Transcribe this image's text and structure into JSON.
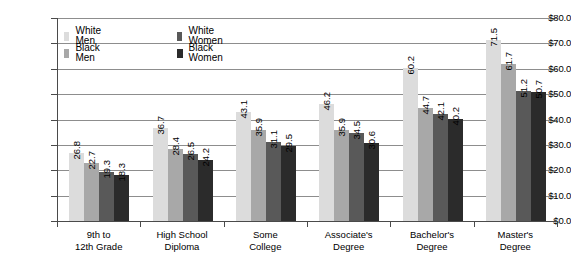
{
  "chart_data": {
    "type": "bar",
    "title": "",
    "subtitle": "",
    "xlabel": "",
    "ylabel": "",
    "ylim": [
      0,
      80
    ],
    "ytick_step": 10,
    "ytick_labels": [
      "$0.0",
      "$10.0",
      "$20.0",
      "$30.0",
      "$40.0",
      "$50.0",
      "$60.0",
      "$70.0",
      "$80.0"
    ],
    "ytick_values": [
      0,
      10,
      20,
      30,
      40,
      50,
      60,
      70,
      80
    ],
    "grid": true,
    "grid_axis": "y",
    "legend_position": "top-left-inside",
    "categories": [
      "9th to\n12th Grade",
      "High School\nDiploma",
      "Some\nCollege",
      "Associate's\nDegree",
      "Bachelor's\nDegree",
      "Master's\nDegree"
    ],
    "category_lines": [
      [
        "9th to",
        "12th Grade"
      ],
      [
        "High School",
        "Diploma"
      ],
      [
        "Some",
        "College"
      ],
      [
        "Associate's",
        "Degree"
      ],
      [
        "Bachelor's",
        "Degree"
      ],
      [
        "Master's",
        "Degree"
      ]
    ],
    "series": [
      {
        "name": "White Men",
        "color": "#dcdcdc",
        "values": [
          26.8,
          36.7,
          43.1,
          46.2,
          60.2,
          71.5
        ]
      },
      {
        "name": "Black Men",
        "color": "#a8a8a8",
        "values": [
          22.7,
          28.4,
          35.9,
          35.9,
          44.7,
          61.7
        ]
      },
      {
        "name": "White Women",
        "color": "#595959",
        "values": [
          19.3,
          26.5,
          31.1,
          34.5,
          42.1,
          51.2
        ]
      },
      {
        "name": "Black Women",
        "color": "#2b2b2b",
        "values": [
          18.3,
          24.2,
          29.5,
          30.6,
          40.2,
          50.7
        ]
      }
    ],
    "value_labels": [
      [
        "26.8",
        "22.7",
        "19.3",
        "18.3"
      ],
      [
        "36.7",
        "28.4",
        "26.5",
        "24.2"
      ],
      [
        "43.1",
        "35.9",
        "31.1",
        "29.5"
      ],
      [
        "46.2",
        "35.9",
        "34.5",
        "30.6"
      ],
      [
        "60.2",
        "44.7",
        "42.1",
        "40.2"
      ],
      [
        "71.5",
        "61.7",
        "51.2",
        "50.7"
      ]
    ],
    "value_label_rotation": -90,
    "legend": [
      {
        "label": "White Men",
        "color": "#dcdcdc"
      },
      {
        "label": "Black Men",
        "color": "#a8a8a8"
      },
      {
        "label": "White Women",
        "color": "#595959"
      },
      {
        "label": "Black Women",
        "color": "#2b2b2b"
      }
    ]
  }
}
